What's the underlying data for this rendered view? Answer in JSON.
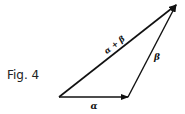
{
  "figure": {
    "caption": "Fig. 4",
    "vectors": {
      "alpha": {
        "label": "α",
        "from": [
          59,
          97
        ],
        "to": [
          128,
          97
        ]
      },
      "beta": {
        "label": "β",
        "from": [
          128,
          97
        ],
        "to": [
          176,
          5
        ]
      },
      "sum": {
        "label": "α + β",
        "from": [
          59,
          97
        ],
        "to": [
          176,
          5
        ]
      }
    }
  }
}
